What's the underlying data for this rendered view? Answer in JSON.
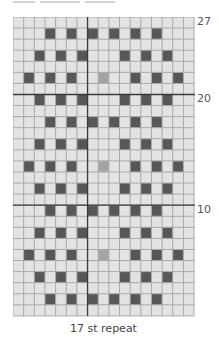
{
  "chart": {
    "columns": 17,
    "rows": 27,
    "row_labels": [
      {
        "row": 27,
        "text": "27"
      },
      {
        "row": 20,
        "text": "20"
      },
      {
        "row": 10,
        "text": "10"
      }
    ],
    "thick_lines": {
      "vertical_after_column": 7,
      "horizontal_above_rows": [
        20,
        10
      ]
    },
    "caption": "17 st repeat",
    "colors": {
      "background_cell": "#e3e3e3",
      "grid_line": "#a9a9a9",
      "dark_cell": "#575757",
      "grey_cell": "#a4a4a4",
      "thick_line": "#3a3a3a"
    },
    "pattern": {
      "27": {
        "dark": [],
        "grey": []
      },
      "26": {
        "dark": [
          4,
          6,
          8,
          10,
          12,
          14
        ],
        "grey": []
      },
      "25": {
        "dark": [],
        "grey": []
      },
      "24": {
        "dark": [
          3,
          5,
          7,
          11,
          13,
          15
        ],
        "grey": []
      },
      "23": {
        "dark": [],
        "grey": []
      },
      "22": {
        "dark": [
          2,
          4,
          6,
          12,
          14,
          16
        ],
        "grey": [
          9
        ]
      },
      "21": {
        "dark": [],
        "grey": []
      },
      "20": {
        "dark": [
          3,
          5,
          7,
          11,
          13,
          15
        ],
        "grey": []
      },
      "19": {
        "dark": [],
        "grey": []
      },
      "18": {
        "dark": [
          4,
          6,
          8,
          10,
          12,
          14
        ],
        "grey": []
      },
      "17": {
        "dark": [],
        "grey": []
      },
      "16": {
        "dark": [
          3,
          5,
          7,
          11,
          13,
          15
        ],
        "grey": []
      },
      "15": {
        "dark": [],
        "grey": []
      },
      "14": {
        "dark": [
          2,
          4,
          6,
          12,
          14,
          16
        ],
        "grey": [
          9
        ]
      },
      "13": {
        "dark": [],
        "grey": []
      },
      "12": {
        "dark": [
          3,
          5,
          7,
          11,
          13,
          15
        ],
        "grey": []
      },
      "11": {
        "dark": [],
        "grey": []
      },
      "10": {
        "dark": [
          4,
          6,
          8,
          10,
          12,
          14
        ],
        "grey": []
      },
      "9": {
        "dark": [],
        "grey": []
      },
      "8": {
        "dark": [
          3,
          5,
          7,
          11,
          13,
          15
        ],
        "grey": []
      },
      "7": {
        "dark": [],
        "grey": []
      },
      "6": {
        "dark": [
          2,
          4,
          6,
          12,
          14,
          16
        ],
        "grey": [
          9
        ]
      },
      "5": {
        "dark": [],
        "grey": []
      },
      "4": {
        "dark": [
          3,
          5,
          7,
          11,
          13,
          15
        ],
        "grey": []
      },
      "3": {
        "dark": [],
        "grey": []
      },
      "2": {
        "dark": [
          4,
          6,
          8,
          10,
          12,
          14
        ],
        "grey": []
      },
      "1": {
        "dark": [],
        "grey": []
      }
    }
  }
}
